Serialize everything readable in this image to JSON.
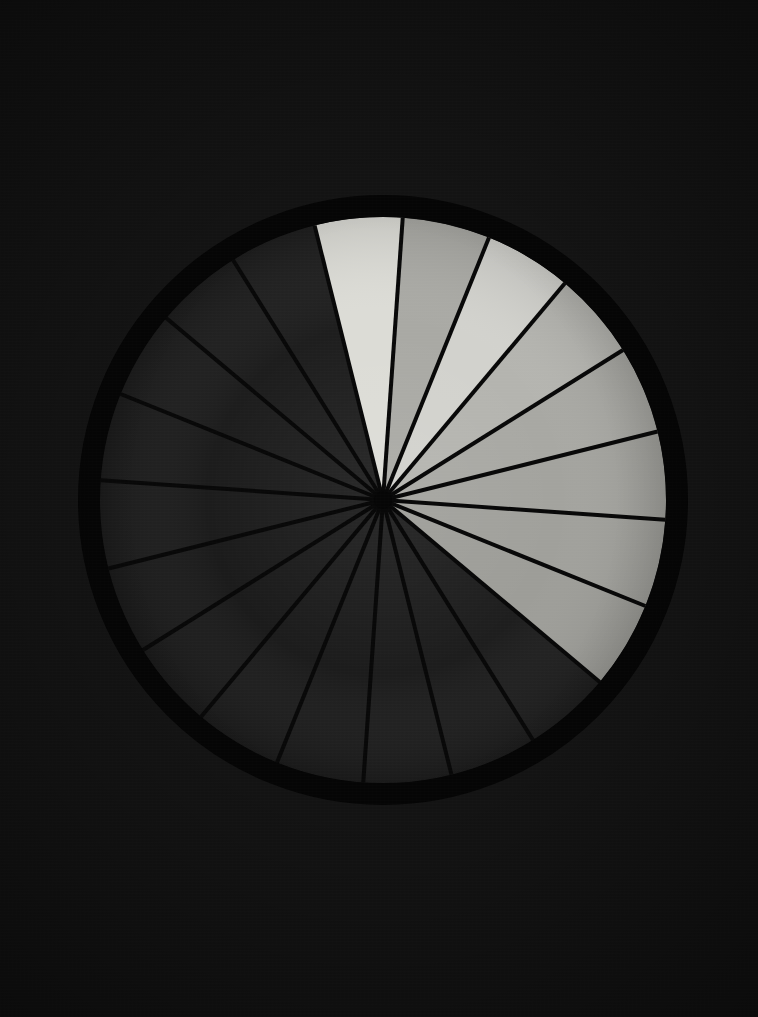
{
  "image": {
    "kind": "radial-sector-test-chart",
    "description": "Dark photograph of a circular radial sector wheel; eight adjacent sectors in the upper-right quadrant are lit in graduated grays while the remaining sectors stay in shadow.",
    "background_color": "#141414",
    "rim_color": "#050505",
    "shadow_sector_color": "#1e1e1e",
    "spoke_line_color": "#080808",
    "hub_color": "#060606"
  },
  "geometry": {
    "canvas_width": 758,
    "canvas_height": 1017,
    "center_x": 383,
    "center_y": 500,
    "outer_radius": 305,
    "inner_radius": 283,
    "rim_thickness": 22,
    "hub_radius": 9,
    "sector_count": 20,
    "sector_angle_degrees": 18,
    "start_angle_degrees": -14
  },
  "chart_data": {
    "type": "pie",
    "title": "",
    "xlabel": "",
    "ylabel": "",
    "legend": "none",
    "grid": false,
    "categories": [
      "S1",
      "S2",
      "S3",
      "S4",
      "S5",
      "S6",
      "S7",
      "S8",
      "S9",
      "S10",
      "S11",
      "S12",
      "S13",
      "S14",
      "S15",
      "S16",
      "S17",
      "S18",
      "S19",
      "S20"
    ],
    "values": [
      18,
      18,
      18,
      18,
      18,
      18,
      18,
      18,
      18,
      18,
      18,
      18,
      18,
      18,
      18,
      18,
      18,
      18,
      18,
      18
    ],
    "slice_colors": [
      "#dcdcd6",
      "#a9a9a4",
      "#d2d2cd",
      "#b4b4af",
      "#a8a8a3",
      "#a3a39e",
      "#a0a09b",
      "#9d9d98",
      "#1e1e1e",
      "#1d1d1d",
      "#1d1d1d",
      "#1c1c1c",
      "#1c1c1c",
      "#1b1b1b",
      "#1b1b1b",
      "#1c1c1c",
      "#1c1c1c",
      "#1d1d1d",
      "#1d1d1d",
      "#1e1e1e"
    ],
    "lit_slice_count": 8,
    "shadow_slice_count": 12
  },
  "sectors": [
    {
      "index": 1,
      "label": "S1",
      "state": "lit",
      "fill": "#dcdcd6",
      "start_deg": -14,
      "end_deg": 4
    },
    {
      "index": 2,
      "label": "S2",
      "state": "lit",
      "fill": "#a9a9a4",
      "start_deg": 4,
      "end_deg": 22
    },
    {
      "index": 3,
      "label": "S3",
      "state": "lit",
      "fill": "#d2d2cd",
      "start_deg": 22,
      "end_deg": 40
    },
    {
      "index": 4,
      "label": "S4",
      "state": "lit",
      "fill": "#b4b4af",
      "start_deg": 40,
      "end_deg": 58
    },
    {
      "index": 5,
      "label": "S5",
      "state": "lit",
      "fill": "#a8a8a3",
      "start_deg": 58,
      "end_deg": 76
    },
    {
      "index": 6,
      "label": "S6",
      "state": "lit",
      "fill": "#a3a39e",
      "start_deg": 76,
      "end_deg": 94
    },
    {
      "index": 7,
      "label": "S7",
      "state": "lit",
      "fill": "#a0a09b",
      "start_deg": 94,
      "end_deg": 112
    },
    {
      "index": 8,
      "label": "S8",
      "state": "lit",
      "fill": "#9d9d98",
      "start_deg": 112,
      "end_deg": 130
    },
    {
      "index": 9,
      "label": "S9",
      "state": "shadow",
      "fill": "#1e1e1e",
      "start_deg": 130,
      "end_deg": 148
    },
    {
      "index": 10,
      "label": "S10",
      "state": "shadow",
      "fill": "#1d1d1d",
      "start_deg": 148,
      "end_deg": 166
    },
    {
      "index": 11,
      "label": "S11",
      "state": "shadow",
      "fill": "#1d1d1d",
      "start_deg": 166,
      "end_deg": 184
    },
    {
      "index": 12,
      "label": "S12",
      "state": "shadow",
      "fill": "#1c1c1c",
      "start_deg": 184,
      "end_deg": 202
    },
    {
      "index": 13,
      "label": "S13",
      "state": "shadow",
      "fill": "#1c1c1c",
      "start_deg": 202,
      "end_deg": 220
    },
    {
      "index": 14,
      "label": "S14",
      "state": "shadow",
      "fill": "#1b1b1b",
      "start_deg": 220,
      "end_deg": 238
    },
    {
      "index": 15,
      "label": "S15",
      "state": "shadow",
      "fill": "#1b1b1b",
      "start_deg": 238,
      "end_deg": 256
    },
    {
      "index": 16,
      "label": "S16",
      "state": "shadow",
      "fill": "#1c1c1c",
      "start_deg": 256,
      "end_deg": 274
    },
    {
      "index": 17,
      "label": "S17",
      "state": "shadow",
      "fill": "#1c1c1c",
      "start_deg": 274,
      "end_deg": 292
    },
    {
      "index": 18,
      "label": "S18",
      "state": "shadow",
      "fill": "#1d1d1d",
      "start_deg": 292,
      "end_deg": 310
    },
    {
      "index": 19,
      "label": "S19",
      "state": "shadow",
      "fill": "#1d1d1d",
      "start_deg": 310,
      "end_deg": 328
    },
    {
      "index": 20,
      "label": "S20",
      "state": "shadow",
      "fill": "#1e1e1e",
      "start_deg": 328,
      "end_deg": 346
    }
  ]
}
